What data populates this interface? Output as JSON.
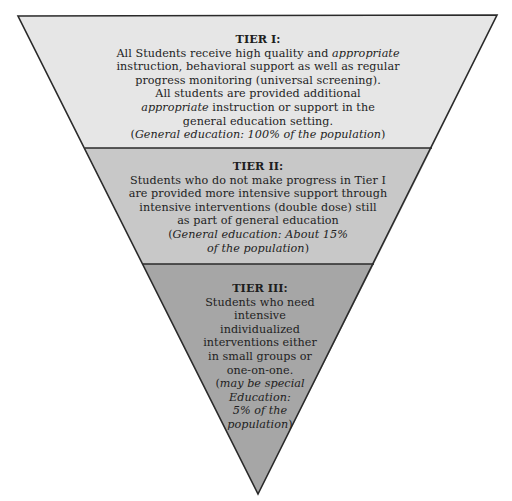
{
  "diagram": {
    "type": "inverted-pyramid",
    "colors": {
      "tier1_fill": "#e6e6e6",
      "tier2_fill": "#c8c8c8",
      "tier3_fill": "#a6a6a6",
      "stroke": "#2a2a2a",
      "text": "#1e1e1e"
    },
    "tiers": [
      {
        "heading": "TIER I:",
        "lines": [
          {
            "pre": "All Students receive high quality and ",
            "em": "appropriate",
            "post": ""
          },
          {
            "pre": "instruction, behavioral support as well as regular",
            "em": "",
            "post": ""
          },
          {
            "pre": "progress monitoring (universal screening).",
            "em": "",
            "post": ""
          },
          {
            "pre": "All students are provided additional",
            "em": "",
            "post": ""
          },
          {
            "pre": "",
            "em": "appropriate",
            "post": " instruction or support in the"
          },
          {
            "pre": "general education setting.",
            "em": "",
            "post": ""
          },
          {
            "pre": "(",
            "em": "General education: 100% of the population",
            "post": ")"
          }
        ],
        "population": "100%"
      },
      {
        "heading": "TIER II:",
        "lines": [
          {
            "pre": "Students who do not make progress in Tier I",
            "em": "",
            "post": ""
          },
          {
            "pre": "are provided more intensive support through",
            "em": "",
            "post": ""
          },
          {
            "pre": "intensive interventions (double dose) still",
            "em": "",
            "post": ""
          },
          {
            "pre": "as part of general education",
            "em": "",
            "post": ""
          },
          {
            "pre": "(",
            "em": "General education: About 15%",
            "post": ""
          },
          {
            "pre": "",
            "em": "of the population",
            "post": ")"
          }
        ],
        "population": "About 15%"
      },
      {
        "heading": "TIER III:",
        "lines": [
          {
            "pre": "Students who need",
            "em": "",
            "post": ""
          },
          {
            "pre": "intensive",
            "em": "",
            "post": ""
          },
          {
            "pre": "individualized",
            "em": "",
            "post": ""
          },
          {
            "pre": "interventions either",
            "em": "",
            "post": ""
          },
          {
            "pre": "in small groups or",
            "em": "",
            "post": ""
          },
          {
            "pre": "one-on-one.",
            "em": "",
            "post": ""
          },
          {
            "pre": "(",
            "em": "may be special",
            "post": ""
          },
          {
            "pre": "",
            "em": "Education:",
            "post": ""
          },
          {
            "pre": "",
            "em": "5% of the",
            "post": ""
          },
          {
            "pre": "",
            "em": "population",
            "post": ")"
          }
        ],
        "population": "5%"
      }
    ]
  }
}
